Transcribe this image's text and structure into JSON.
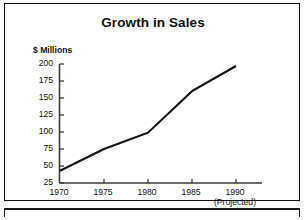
{
  "chart_data": {
    "type": "line",
    "title": "Growth in Sales",
    "xlabel": "",
    "ylabel": "$ Millions",
    "x": [
      1970,
      1975,
      1980,
      1985,
      1990
    ],
    "categories": [
      "1970",
      "1975",
      "1980",
      "1985",
      "1990"
    ],
    "values": [
      43,
      75,
      99,
      160,
      197
    ],
    "series": [
      {
        "name": "Sales",
        "values": [
          43,
          75,
          99,
          160,
          197
        ]
      }
    ],
    "ylim": [
      25,
      200
    ],
    "xlim": [
      1970,
      1990
    ],
    "yticks": [
      200,
      175,
      150,
      125,
      100,
      75,
      50,
      25
    ],
    "ytick_labels": [
      "200",
      "175",
      "150",
      "125",
      "100",
      "75",
      "50",
      "25"
    ],
    "xtick_labels": [
      "1970",
      "1975",
      "1980",
      "1985",
      "1990"
    ],
    "annotations": [
      "(Projected)"
    ],
    "grid": false,
    "legend": false,
    "legend_position": "none",
    "line_color": "#111111",
    "axis_color": "#3a3a3a",
    "background_color": "#ffffff"
  },
  "chart": {
    "title": "Growth in Sales",
    "y_axis_caption": "$ Millions",
    "projected_note": "(Projected)"
  }
}
